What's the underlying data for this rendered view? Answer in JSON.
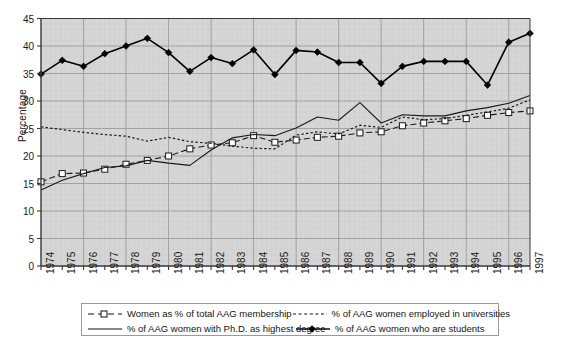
{
  "chart_data": {
    "type": "line",
    "title": "",
    "xlabel": "",
    "ylabel": "Percentage",
    "ylim": [
      0,
      45
    ],
    "ytick_step": 5,
    "yticks": [
      0,
      5,
      10,
      15,
      20,
      25,
      30,
      35,
      40,
      45
    ],
    "grid": true,
    "legend_position": "bottom",
    "plot_background": "#d6d6d6",
    "axis_color": "#3a3a3a",
    "grid_color": "#9c9c9c",
    "categories": [
      "1974",
      "1975",
      "1976",
      "1977",
      "1978",
      "1979",
      "1980",
      "1981",
      "1982",
      "1983",
      "1984",
      "1985",
      "1986",
      "1987",
      "1988",
      "1989",
      "1990",
      "1991",
      "1992",
      "1993",
      "1994",
      "1995",
      "1996",
      "1997"
    ],
    "x": [
      1974,
      1975,
      1976,
      1977,
      1978,
      1979,
      1980,
      1981,
      1982,
      1983,
      1984,
      1985,
      1986,
      1987,
      1988,
      1989,
      1990,
      1991,
      1992,
      1993,
      1994,
      1995,
      1996,
      1997
    ],
    "series": [
      {
        "name": "Women as % of total AAG membership",
        "style": "dashed-open-square",
        "color": "#1a1a1a",
        "values": [
          15.3,
          16.8,
          16.9,
          17.6,
          18.5,
          19.2,
          20.0,
          21.3,
          22.0,
          22.4,
          23.7,
          22.5,
          22.9,
          23.4,
          23.6,
          24.2,
          24.4,
          25.5,
          26.0,
          26.4,
          26.8,
          27.4,
          27.9,
          28.2
        ]
      },
      {
        "name": "% of AAG women employed in universities",
        "style": "dotted",
        "color": "#1a1a1a",
        "values": [
          25.3,
          24.8,
          24.3,
          23.9,
          23.6,
          22.7,
          23.4,
          22.6,
          22.3,
          21.8,
          21.4,
          21.3,
          23.8,
          24.4,
          24.0,
          25.6,
          25.2,
          27.1,
          26.6,
          26.8,
          27.4,
          28.0,
          28.7,
          30.2
        ]
      },
      {
        "name": "% of AAG women with Ph.D. as highest degree",
        "style": "solid",
        "color": "#1a1a1a",
        "values": [
          13.8,
          15.6,
          16.8,
          17.9,
          18.2,
          19.2,
          18.7,
          18.3,
          21.1,
          23.3,
          23.9,
          23.7,
          25.1,
          27.1,
          26.5,
          29.7,
          26.0,
          27.5,
          27.3,
          27.3,
          28.2,
          28.8,
          29.6,
          31.0
        ]
      },
      {
        "name": "% of AAG women who are students",
        "style": "solid-filled-diamond",
        "color": "#000000",
        "values": [
          34.9,
          37.4,
          36.3,
          38.6,
          40.0,
          41.4,
          38.8,
          35.4,
          37.9,
          36.8,
          39.3,
          34.8,
          39.2,
          38.9,
          37.0,
          37.0,
          33.2,
          36.3,
          37.2,
          37.2,
          37.2,
          32.9,
          40.7,
          42.3
        ]
      }
    ]
  },
  "legend": {
    "items": [
      {
        "label": "Women as % of total AAG membership",
        "symbol": "dashed-open-square"
      },
      {
        "label": "% of AAG women employed in universities",
        "symbol": "dotted"
      },
      {
        "label": "% of AAG women with Ph.D. as highest degree",
        "symbol": "solid"
      },
      {
        "label": "% of AAG women who are students",
        "symbol": "solid-filled-diamond"
      }
    ]
  }
}
